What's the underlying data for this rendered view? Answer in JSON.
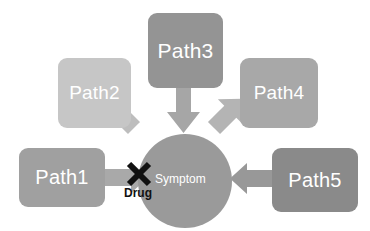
{
  "diagram": {
    "background_color": "#ffffff",
    "nodes": [
      {
        "id": "path1",
        "label": "Path1",
        "shape": "rounded-rect",
        "color": "#a0a0a0",
        "text_color": "#ffffff",
        "x": 19,
        "y": 148,
        "w": 86,
        "h": 59,
        "font_size": 20
      },
      {
        "id": "path2",
        "label": "Path2",
        "shape": "rounded-rect",
        "color": "#c6c6c6",
        "text_color": "#ffffff",
        "x": 58,
        "y": 58,
        "w": 73,
        "h": 70,
        "font_size": 19
      },
      {
        "id": "path3",
        "label": "Path3",
        "shape": "rounded-rect",
        "color": "#949494",
        "text_color": "#ffffff",
        "x": 148,
        "y": 13,
        "w": 75,
        "h": 75,
        "font_size": 21
      },
      {
        "id": "path4",
        "label": "Path4",
        "shape": "rounded-rect",
        "color": "#a8a8a8",
        "text_color": "#ffffff",
        "x": 240,
        "y": 58,
        "w": 78,
        "h": 70,
        "font_size": 19
      },
      {
        "id": "path5",
        "label": "Path5",
        "shape": "rounded-rect",
        "color": "#8a8a8a",
        "text_color": "#ffffff",
        "x": 272,
        "y": 148,
        "w": 86,
        "h": 64,
        "font_size": 20
      }
    ],
    "center": {
      "id": "symptom",
      "label": "Symptom",
      "shape": "circle",
      "color": "#9a9a9a",
      "text_color": "#ffffff",
      "cx": 185,
      "cy": 181,
      "r": 47,
      "label_x": 155,
      "label_y": 172,
      "font_size": 12
    },
    "blocker": {
      "id": "drug",
      "label": "Drug",
      "marker": "x-cross",
      "marker_color": "#111111",
      "text_color": "#111111",
      "marker_cx": 139,
      "marker_cy": 174,
      "marker_size": 26,
      "label_x": 124,
      "label_y": 186,
      "font_size": 12
    },
    "arrows": [
      {
        "id": "arrow-path1-symptom",
        "from": "path1",
        "to": "symptom",
        "direction": "right",
        "color": "#a9a9a9",
        "blocked": true
      },
      {
        "id": "arrow-path2-symptom",
        "from": "path2",
        "to": "symptom",
        "direction": "down-right",
        "color": "#bdbdbd",
        "blocked": false
      },
      {
        "id": "arrow-path3-symptom",
        "from": "path3",
        "to": "symptom",
        "direction": "down",
        "color": "#a6a6a6",
        "blocked": false
      },
      {
        "id": "arrow-path4-symptom",
        "from": "path4",
        "to": "symptom",
        "direction": "down-left",
        "color": "#b4b4b4",
        "blocked": false
      },
      {
        "id": "arrow-path5-symptom",
        "from": "path5",
        "to": "symptom",
        "direction": "left",
        "color": "#989898",
        "blocked": false
      }
    ]
  }
}
